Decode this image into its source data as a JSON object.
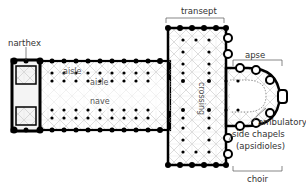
{
  "diagram": {
    "type": "cathedral floor plan",
    "labels": {
      "narthex": "narthex",
      "transept": "transept",
      "apse": "apse",
      "aisle_outer": "aisle",
      "aisle_inner": "aisle",
      "nave": "nave",
      "crossing": "crossing",
      "ambulatory": "ambulatory",
      "side_chapels": "side chapels",
      "apsidioles": "(apsidioles)",
      "choir": "choir"
    },
    "colors": {
      "walls": "#000000",
      "vaulting": "#999999",
      "labels": "#333333",
      "background": "#ffffff"
    }
  }
}
